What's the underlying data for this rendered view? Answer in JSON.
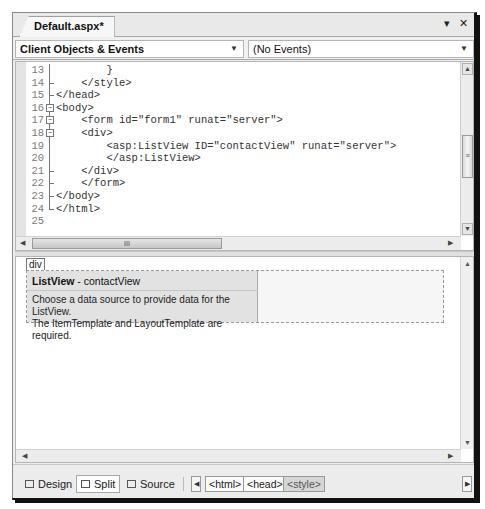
{
  "document_tab": {
    "title": "Default.aspx*",
    "controls": {
      "menu": "▾",
      "close": "✕"
    }
  },
  "navbar": {
    "object_combo": {
      "value": "Client Objects & Events"
    },
    "event_combo": {
      "value": "(No Events)"
    }
  },
  "code_editor": {
    "lines": [
      {
        "num": "13",
        "fold": "line",
        "text": "        }"
      },
      {
        "num": "14",
        "fold": "tick",
        "text": "    </style>"
      },
      {
        "num": "15",
        "fold": "tick",
        "text": "</head>"
      },
      {
        "num": "16",
        "fold": "box",
        "text": "<body>"
      },
      {
        "num": "17",
        "fold": "box",
        "text": "    <form id=\"form1\" runat=\"server\">"
      },
      {
        "num": "18",
        "fold": "box",
        "text": "    <div>"
      },
      {
        "num": "19",
        "fold": "line",
        "text": "        <asp:ListView ID=\"contactView\" runat=\"server\">"
      },
      {
        "num": "20",
        "fold": "line",
        "text": "        </asp:ListView>"
      },
      {
        "num": "21",
        "fold": "tick",
        "text": "    </div>"
      },
      {
        "num": "22",
        "fold": "tick",
        "text": "    </form>"
      },
      {
        "num": "23",
        "fold": "tick",
        "text": "</body>"
      },
      {
        "num": "24",
        "fold": "end",
        "text": "</html>"
      },
      {
        "num": "25",
        "fold": "none",
        "text": ""
      }
    ],
    "hscroll_thumb_glyph": "III",
    "vscroll_thumb_glyph": "≡"
  },
  "design_view": {
    "div_tag": "div",
    "listview": {
      "control_type": "ListView",
      "separator": " - ",
      "control_id": "contactView",
      "description_line1": "Choose a data source to provide data for the ListView.",
      "description_line2": "The ItemTemplate and LayoutTemplate are required."
    }
  },
  "bottom_bar": {
    "views": [
      {
        "label": "Design",
        "active": false
      },
      {
        "label": "Split",
        "active": true
      },
      {
        "label": "Source",
        "active": false
      }
    ],
    "breadcrumbs": [
      {
        "label": "<html>",
        "selected": false
      },
      {
        "label": "<head>",
        "selected": false
      },
      {
        "label": "<style>",
        "selected": true
      }
    ]
  }
}
